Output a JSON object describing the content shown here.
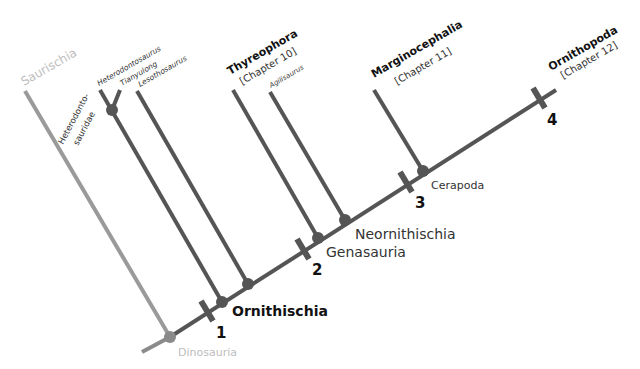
{
  "diagram": {
    "type": "cladogram",
    "colors": {
      "main": "#555555",
      "saurischia": "#9a9a9a",
      "faint_label": "#bdbdbd",
      "label": "#333333",
      "bold_label": "#111111"
    },
    "labels": {
      "saurischia": "Saurischia",
      "dinosauria": "Dinosauria",
      "heterodontosauridae_1": "Heterodonto-",
      "heterodontosauridae_2": "sauridae",
      "heterodontosaurus": "Heterodontosaurus",
      "tianyulong": "Tianyulong",
      "lesothosaurus": "Lesothosaurus",
      "thyreophora": "Thyreophora",
      "thyreophora_chapter": "[Chapter 10]",
      "agilisaurus": "Agilisaurus",
      "marginocephalia": "Marginocephalia",
      "marginocephalia_chapter": "[Chapter 11]",
      "ornithopoda": "Ornithopoda",
      "ornithopoda_chapter": "[Chapter 12]",
      "ornithischia": "Ornithischia",
      "genasauria": "Genasauria",
      "neornithischia": "Neornithischia",
      "cerapoda": "Cerapoda"
    },
    "synapomorphy_ticks": [
      "1",
      "2",
      "3",
      "4"
    ]
  }
}
